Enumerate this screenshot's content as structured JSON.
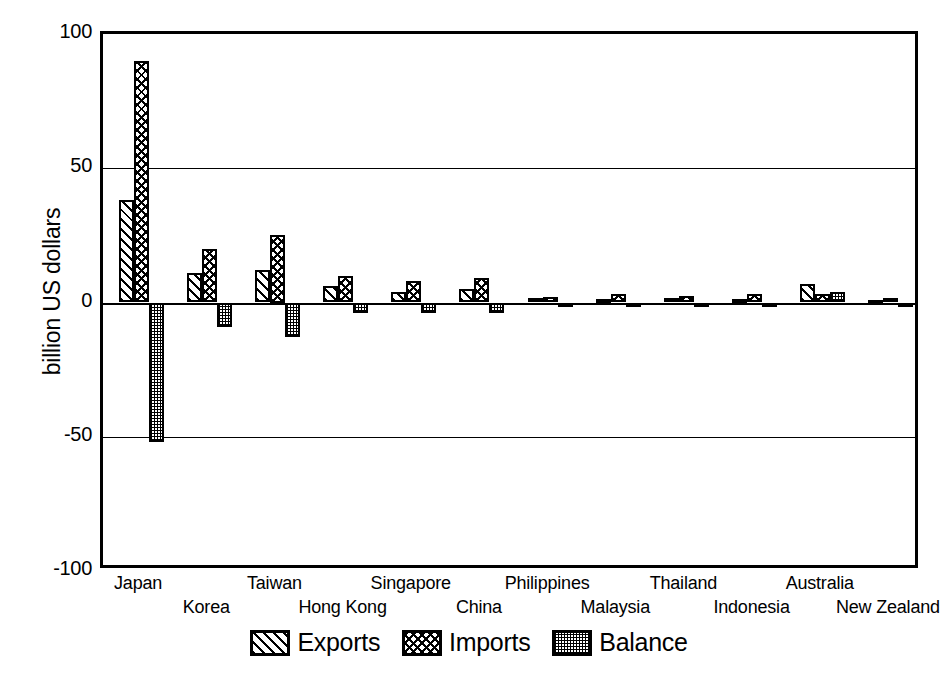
{
  "chart_data": {
    "type": "bar",
    "title": "",
    "subtitle": "",
    "xlabel": "",
    "ylabel": "billion US dollars",
    "ylim": [
      -100,
      100
    ],
    "yticks": [
      100,
      50,
      0,
      -50,
      -100
    ],
    "ytick_labels": [
      "100",
      "50",
      "0",
      "-50",
      "-100"
    ],
    "grid": true,
    "grid_axis": "y",
    "legend_position": "bottom",
    "categories": [
      "Japan",
      "Korea",
      "Taiwan",
      "Hong Kong",
      "Singapore",
      "China",
      "Philippines",
      "Malaysia",
      "Thailand",
      "Indonesia",
      "Australia",
      "New Zealand"
    ],
    "series": [
      {
        "name": "Exports",
        "pattern": "diagonal-hatch",
        "values": [
          38,
          11,
          12,
          6,
          4,
          5,
          1.5,
          1.2,
          1.5,
          1.2,
          7,
          1
        ]
      },
      {
        "name": "Imports",
        "pattern": "crosshatch",
        "values": [
          90,
          20,
          25,
          10,
          8,
          9,
          2,
          3,
          2.5,
          3,
          3,
          1.5
        ]
      },
      {
        "name": "Balance",
        "pattern": "stipple",
        "values": [
          -52,
          -9,
          -13,
          -4,
          -4,
          -4,
          -0.5,
          -1.8,
          -1,
          -1.8,
          4,
          -0.5
        ]
      }
    ]
  },
  "axes": {
    "y_title": "billion US dollars"
  },
  "legend": {
    "items": [
      {
        "label": "Exports",
        "pattern": "diagonal-hatch"
      },
      {
        "label": "Imports",
        "pattern": "crosshatch"
      },
      {
        "label": "Balance",
        "pattern": "stipple"
      }
    ]
  }
}
